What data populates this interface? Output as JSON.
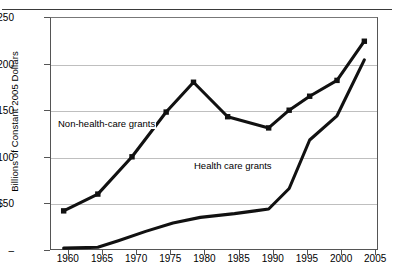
{
  "figure": {
    "ylabel": "Billions of Constant 2005 Dollars",
    "zero_tick_label": "–"
  },
  "labels": {
    "series_nonhealth": "Non-health-care grants",
    "series_health": "Health care grants"
  },
  "chart_data": {
    "type": "line",
    "title": "",
    "xlabel": "",
    "ylabel": "Billions of Constant 2005 Dollars",
    "xlim": [
      1958,
      2006
    ],
    "ylim": [
      0,
      250
    ],
    "grid": true,
    "legend": "inline-annotations",
    "ytick_labels": [
      "$250",
      "$200",
      "$150",
      "$100",
      "$50",
      "–"
    ],
    "ytick_values": [
      250,
      200,
      150,
      100,
      50,
      0
    ],
    "xtick_labels": [
      "1960",
      "1965",
      "1970",
      "1975",
      "1980",
      "1985",
      "1990",
      "1995",
      "2000",
      "2005"
    ],
    "xtick_values": [
      1960,
      1965,
      1970,
      1975,
      1980,
      1985,
      1990,
      1995,
      2000,
      2005
    ],
    "series": [
      {
        "name": "Non-health-care grants",
        "marker": "square",
        "x": [
          1960,
          1965,
          1970,
          1975,
          1979,
          1984,
          1990,
          1993,
          1996,
          2000,
          2004
        ],
        "values": [
          42,
          60,
          100,
          148,
          180,
          143,
          131,
          150,
          165,
          182,
          224
        ]
      },
      {
        "name": "Health care grants",
        "marker": "none",
        "x": [
          1960,
          1965,
          1968,
          1972,
          1976,
          1980,
          1985,
          1988,
          1990,
          1993,
          1996,
          2000,
          2004
        ],
        "values": [
          2,
          3,
          10,
          20,
          29,
          35,
          39,
          42,
          44,
          66,
          118,
          144,
          204
        ]
      }
    ]
  }
}
